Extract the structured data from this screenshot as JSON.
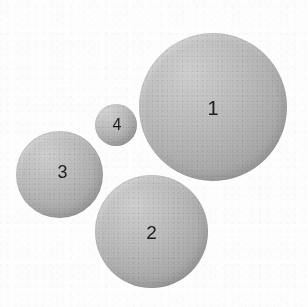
{
  "figure": {
    "background_color": "#fdfdfd",
    "canvas_width": 308,
    "canvas_height": 307
  },
  "chart_data": {
    "type": "scatter",
    "title": "",
    "xlabel": "",
    "ylabel": "",
    "grid": false,
    "legend": null,
    "xlim": [
      0,
      308
    ],
    "ylim": [
      0,
      307
    ],
    "note": "Bubble-style plate: four grey gradient-shaded circles, each annotated with its index number.",
    "categories": [
      "1",
      "2",
      "3",
      "4"
    ],
    "values": [
      148,
      113,
      87,
      42
    ],
    "series": [
      {
        "name": "diameter_px",
        "values": [
          148,
          113,
          87,
          42
        ]
      },
      {
        "name": "center_x_px",
        "values": [
          213,
          151,
          59,
          116
        ]
      },
      {
        "name": "center_y_px",
        "values": [
          107,
          231,
          174,
          125
        ]
      }
    ],
    "points": [
      {
        "label": "1",
        "cx": 213,
        "cy": 107,
        "diameter": 148,
        "radius": 74,
        "fill": "#b4b4b4"
      },
      {
        "label": "2",
        "cx": 151,
        "cy": 231,
        "diameter": 113,
        "radius": 56.5,
        "fill": "#b4b4b4"
      },
      {
        "label": "3",
        "cx": 59,
        "cy": 174,
        "diameter": 87,
        "radius": 43.5,
        "fill": "#b4b4b4"
      },
      {
        "label": "4",
        "cx": 116,
        "cy": 125,
        "diameter": 42,
        "radius": 21,
        "fill": "#b4b4b4"
      }
    ]
  },
  "spheres": [
    {
      "id": "sphere-1",
      "label": "1"
    },
    {
      "id": "sphere-2",
      "label": "2"
    },
    {
      "id": "sphere-3",
      "label": "3"
    },
    {
      "id": "sphere-4",
      "label": "4"
    }
  ],
  "colors": {
    "sphere_highlight": "#cfcfcf",
    "sphere_midtone": "#b4b4b4",
    "sphere_shadow": "#979797",
    "label_text": "#1d1d1d",
    "background": "#fdfdfd"
  }
}
